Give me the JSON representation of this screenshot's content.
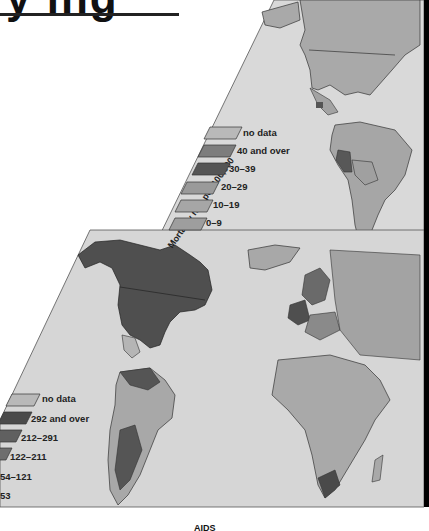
{
  "title": {
    "fragment": "y ing"
  },
  "upper_map": {
    "region": "Americas",
    "axis_label": "Mortality rate per 100,000",
    "legend": [
      {
        "label": "no data",
        "color": "#b9b9b9"
      },
      {
        "label": "40 and over",
        "color": "#7d7d7d"
      },
      {
        "label": "30–39",
        "color": "#555555"
      },
      {
        "label": "20–29",
        "color": "#9a9a9a"
      },
      {
        "label": "10–19",
        "color": "#a6a6a6"
      },
      {
        "label": "0–9",
        "color": "#9e9e9e"
      }
    ]
  },
  "lower_map": {
    "region": "Western Hemisphere, Europe and Africa",
    "legend": [
      {
        "label": "no data",
        "color": "#b9b9b9"
      },
      {
        "label": "292 and over",
        "color": "#4a4a4a"
      },
      {
        "label": "212–291",
        "color": "#606060"
      },
      {
        "label": "122–211",
        "color": "#6e6e6e"
      },
      {
        "label": "54–121",
        "color": "#8a8a8a"
      },
      {
        "label": "53",
        "color": "#a8a8a8"
      }
    ]
  },
  "caption": "AIDS",
  "colors": {
    "panel_bg": "#dcdcdc",
    "land_light": "#a8a8a8",
    "land_dark": "#4f4f4f",
    "border": "#333333"
  }
}
